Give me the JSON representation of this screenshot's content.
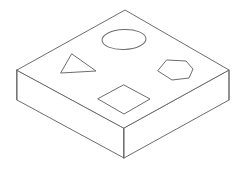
{
  "scene": {
    "title": "Isometric slab with four cut-out shapes",
    "background_color": "#ffffff",
    "line_color": "#6d6d6d",
    "fill_color": "#ffffff",
    "stroke_width": 1,
    "canvas": {
      "width": 239,
      "height": 169
    },
    "projection": "isometric",
    "object_name": "rectangular-slab",
    "extrusion_depth_px": 30
  },
  "solid": {
    "name": "slab",
    "top_face": {
      "name": "top-face",
      "points": "17,70 125,10 229,70 124,128",
      "vertices": {
        "left": [
          17,
          70
        ],
        "back": [
          125,
          10
        ],
        "right": [
          229,
          70
        ],
        "front": [
          124,
          128
        ]
      }
    },
    "left_face": {
      "name": "left-front-face",
      "points": "17,70 124,128 124,158 17,100"
    },
    "right_face": {
      "name": "right-front-face",
      "points": "124,128 229,70 229,100 124,158"
    },
    "front_vertical_edge": {
      "name": "front-corner-edge",
      "from": [
        124,
        128
      ],
      "to": [
        124,
        158
      ]
    },
    "left_vertical_edge": {
      "name": "left-corner-edge",
      "from": [
        17,
        70
      ],
      "to": [
        17,
        100
      ]
    },
    "right_vertical_edge": {
      "name": "right-corner-edge",
      "from": [
        229,
        70
      ],
      "to": [
        229,
        100
      ]
    }
  },
  "shapes": [
    {
      "id": "ellipse",
      "name": "ellipse-cutout",
      "label": "ellipse",
      "kind": "ellipse",
      "cx": 124,
      "cy": 39.5,
      "rx": 22,
      "ry": 10,
      "rotation": -2
    },
    {
      "id": "triangle",
      "name": "triangle-cutout",
      "label": "triangle",
      "kind": "polygon",
      "points": "72,54 96,71 61,73"
    },
    {
      "id": "hexagon",
      "name": "hexagon-cutout",
      "label": "hexagon",
      "kind": "polygon",
      "points": "167,60 186,61 193,69 189,78 172,80 158,71"
    },
    {
      "id": "diamond",
      "name": "diamond-cutout",
      "label": "diamond",
      "kind": "polygon",
      "points": "124,85 150,99 124,114 98,99"
    }
  ]
}
